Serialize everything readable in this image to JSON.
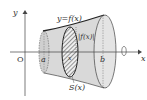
{
  "diagram": {
    "type": "solid-of-revolution",
    "labels": {
      "curve": "y=f(x)",
      "radius": "|f(x)|",
      "cross_section": "S(x)",
      "origin": "O",
      "a": "a",
      "b": "b",
      "x_axis": "x",
      "y_axis": "y",
      "x_point": "x"
    },
    "colors": {
      "solid_fill": "#d9d9d9",
      "outline": "#333333",
      "axis": "#444444",
      "hatch": "#555555"
    }
  }
}
